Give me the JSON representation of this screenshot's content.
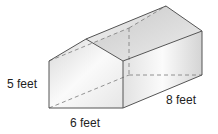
{
  "diagram": {
    "type": "pentagonal-prism (house shape)",
    "labels": {
      "height": "5 feet",
      "width": "6 feet",
      "length": "8 feet"
    },
    "colors": {
      "edge": "#555555",
      "hidden_edge": "#777777",
      "roof_fill": "#d6d6d6",
      "side_fill": "#e8e8e8",
      "front_fill": "#f2f2f2"
    }
  }
}
